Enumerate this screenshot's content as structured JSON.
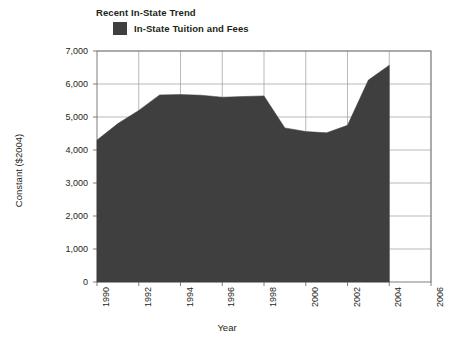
{
  "chart_data": {
    "type": "area",
    "title": "Recent In-State Trend",
    "xlabel": "Year",
    "ylabel": "Constant ($2004)",
    "legend": [
      {
        "label": "In-State Tuition and Fees",
        "color": "#3f3f3f"
      }
    ],
    "legend_position": "top-left",
    "grid": true,
    "xlim": [
      1990,
      2006
    ],
    "ylim": [
      0,
      7000
    ],
    "xticks": [
      1990,
      1992,
      1994,
      1996,
      1998,
      2000,
      2002,
      2004,
      2006
    ],
    "xtick_labels": [
      "1990",
      "1992",
      "1994",
      "1996",
      "1998",
      "2000",
      "2002",
      "2004",
      "2006"
    ],
    "yticks": [
      0,
      1000,
      2000,
      3000,
      4000,
      5000,
      6000,
      7000
    ],
    "ytick_labels": [
      "0",
      "1,000",
      "2,000",
      "3,000",
      "4,000",
      "5,000",
      "6,000",
      "7,000"
    ],
    "series": [
      {
        "name": "In-State Tuition and Fees",
        "color": "#3f3f3f",
        "x": [
          1990,
          1991,
          1992,
          1993,
          1994,
          1995,
          1996,
          1997,
          1998,
          1999,
          2000,
          2001,
          2002,
          2003,
          2004
        ],
        "values": [
          4300,
          4800,
          5200,
          5670,
          5680,
          5660,
          5600,
          5620,
          5640,
          4670,
          4560,
          4520,
          4750,
          6120,
          6570
        ]
      }
    ]
  },
  "axes": {
    "y_label": "Constant ($2004)",
    "x_label": "Year"
  }
}
